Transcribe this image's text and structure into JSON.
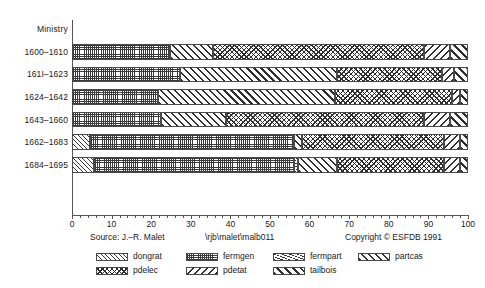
{
  "chart_data": {
    "type": "bar",
    "orientation": "horizontal",
    "stacked": true,
    "title": "",
    "xlabel": "",
    "ylabel": "Ministry",
    "xlim": [
      0,
      100
    ],
    "xticks": [
      0,
      10,
      20,
      30,
      40,
      50,
      60,
      70,
      80,
      90,
      100
    ],
    "xtick_labels": [
      "0",
      "10",
      "20",
      "30",
      "40",
      "50",
      "60",
      "70",
      "80",
      "90",
      "100"
    ],
    "grid": false,
    "legend_position": "bottom",
    "categories": [
      "1600–1610",
      "161I–1623",
      "1624–1642",
      "1643–1660",
      "1662–1683",
      "1684–1695"
    ],
    "series": [
      {
        "name": "dongrat",
        "pattern": "light-diagonal",
        "values": [
          0,
          0,
          0,
          0,
          4.5,
          5.5
        ]
      },
      {
        "name": "fermgen",
        "pattern": "dotted-checker",
        "values": [
          24.8,
          27.3,
          21.6,
          22.4,
          51.5,
          50.5
        ]
      },
      {
        "name": "fermpart",
        "pattern": "fine-hatch",
        "values": [
          0,
          0,
          0,
          0,
          0,
          1.0
        ]
      },
      {
        "name": "partcas",
        "pattern": "bold-diagonal",
        "values": [
          10.7,
          39.6,
          44.8,
          16.6,
          2.0,
          10.0
        ]
      },
      {
        "name": "pdelec",
        "pattern": "cross-hatch",
        "values": [
          53.5,
          26.6,
          29.6,
          50.0,
          36.0,
          27.0
        ]
      },
      {
        "name": "pdetat",
        "pattern": "chevron",
        "values": [
          6.5,
          3.0,
          2.0,
          6.5,
          4.0,
          4.0
        ]
      },
      {
        "name": "tailbois",
        "pattern": "bold-diagonal-2",
        "values": [
          4.5,
          3.5,
          2.0,
          4.5,
          2.0,
          2.0
        ]
      }
    ],
    "rows": [
      {
        "category": "1600–1610",
        "segments": [
          {
            "name": "fermgen",
            "start": 0,
            "end": 24.8
          },
          {
            "name": "partcas",
            "start": 24.8,
            "end": 35.5
          },
          {
            "name": "pdelec",
            "start": 35.5,
            "end": 89.0
          },
          {
            "name": "pdetat",
            "start": 89.0,
            "end": 95.5
          },
          {
            "name": "tailbois",
            "start": 95.5,
            "end": 100
          }
        ]
      },
      {
        "category": "161I–1623",
        "segments": [
          {
            "name": "fermgen",
            "start": 0,
            "end": 27.3
          },
          {
            "name": "partcas",
            "start": 27.3,
            "end": 66.9
          },
          {
            "name": "pdelec",
            "start": 66.9,
            "end": 93.5
          },
          {
            "name": "pdetat",
            "start": 93.5,
            "end": 96.5
          },
          {
            "name": "tailbois",
            "start": 96.5,
            "end": 100
          }
        ]
      },
      {
        "category": "1624–1642",
        "segments": [
          {
            "name": "fermgen",
            "start": 0,
            "end": 21.6
          },
          {
            "name": "partcas",
            "start": 21.6,
            "end": 66.4
          },
          {
            "name": "pdelec",
            "start": 66.4,
            "end": 96.0
          },
          {
            "name": "pdetat",
            "start": 96.0,
            "end": 98.0
          },
          {
            "name": "tailbois",
            "start": 98.0,
            "end": 100
          }
        ]
      },
      {
        "category": "1643–1660",
        "segments": [
          {
            "name": "fermgen",
            "start": 0,
            "end": 22.4
          },
          {
            "name": "partcas",
            "start": 22.4,
            "end": 39.0
          },
          {
            "name": "pdelec",
            "start": 39.0,
            "end": 89.0
          },
          {
            "name": "pdetat",
            "start": 89.0,
            "end": 95.5
          },
          {
            "name": "tailbois",
            "start": 95.5,
            "end": 100
          }
        ]
      },
      {
        "category": "1662–1683",
        "segments": [
          {
            "name": "dongrat",
            "start": 0,
            "end": 4.5
          },
          {
            "name": "fermgen",
            "start": 4.5,
            "end": 56.0
          },
          {
            "name": "partcas",
            "start": 56.0,
            "end": 58.0
          },
          {
            "name": "pdelec",
            "start": 58.0,
            "end": 94.0
          },
          {
            "name": "pdetat",
            "start": 94.0,
            "end": 98.0
          },
          {
            "name": "tailbois",
            "start": 98.0,
            "end": 100
          }
        ]
      },
      {
        "category": "1684–1695",
        "segments": [
          {
            "name": "dongrat",
            "start": 0,
            "end": 5.5
          },
          {
            "name": "fermgen",
            "start": 5.5,
            "end": 56.0
          },
          {
            "name": "fermpart",
            "start": 56.0,
            "end": 57.0
          },
          {
            "name": "partcas",
            "start": 57.0,
            "end": 67.0
          },
          {
            "name": "pdelec",
            "start": 67.0,
            "end": 94.0
          },
          {
            "name": "pdetat",
            "start": 94.0,
            "end": 98.0
          },
          {
            "name": "tailbois",
            "start": 98.0,
            "end": 100
          }
        ]
      }
    ]
  },
  "axis": {
    "y_axis_title": "Ministry"
  },
  "footer": {
    "source": "Source: J.–R. Malet",
    "path": "\\rjb\\malet\\malb011",
    "copyright": "Copyright © ESFDB 1991"
  },
  "legend": {
    "row1": [
      {
        "label": "dongrat",
        "pattern": "light-diagonal"
      },
      {
        "label": "fermgen",
        "pattern": "dotted-checker"
      },
      {
        "label": "fermpart",
        "pattern": "fine-hatch"
      },
      {
        "label": "partcas",
        "pattern": "bold-diagonal"
      }
    ],
    "row2": [
      {
        "label": "pdelec",
        "pattern": "cross-hatch"
      },
      {
        "label": "pdetat",
        "pattern": "chevron"
      },
      {
        "label": "tailbois",
        "pattern": "bold-diagonal-2"
      }
    ]
  }
}
